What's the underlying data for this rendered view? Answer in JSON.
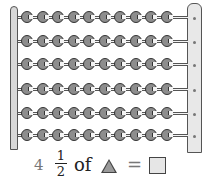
{
  "abacus": {
    "rows": 6,
    "beads_per_row": 10,
    "right_post_holes": 6,
    "colors": {
      "bead": "#8d8d8d",
      "frame": "#d8d8d8",
      "outline": "#333333"
    }
  },
  "problem": {
    "number": "4",
    "fraction_numerator": "1",
    "fraction_denominator": "2",
    "of_text": "of",
    "shape": "triangle",
    "equals": "=",
    "answer_box": ""
  }
}
